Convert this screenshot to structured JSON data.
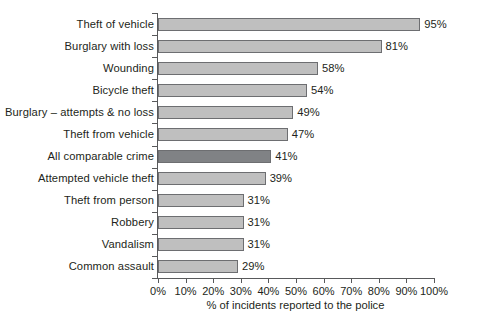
{
  "chart_data": {
    "type": "bar",
    "orientation": "horizontal",
    "title": "",
    "subtitle": "",
    "xlabel": "% of incidents reported to the police",
    "ylabel": "",
    "xlim": [
      0,
      100
    ],
    "xticks": [
      0,
      10,
      20,
      30,
      40,
      50,
      60,
      70,
      80,
      90,
      100
    ],
    "xtick_labels": [
      "0%",
      "10%",
      "20%",
      "30%",
      "40%",
      "50%",
      "60%",
      "70%",
      "80%",
      "90%",
      "100%"
    ],
    "grid": false,
    "legend": "none",
    "categories": [
      "Theft of vehicle",
      "Burglary with loss",
      "Wounding",
      "Bicycle theft",
      "Burglary – attempts & no loss",
      "Theft from vehicle",
      "All comparable crime",
      "Attempted vehicle theft",
      "Theft from person",
      "Robbery",
      "Vandalism",
      "Common assault"
    ],
    "values": [
      95,
      81,
      58,
      54,
      49,
      47,
      41,
      39,
      31,
      31,
      31,
      29
    ],
    "value_labels": [
      "95%",
      "81%",
      "58%",
      "54%",
      "49%",
      "47%",
      "41%",
      "39%",
      "31%",
      "31%",
      "31%",
      "29%"
    ],
    "highlighted_index": 6,
    "colors": {
      "bar_fill": "#bfbfbf",
      "bar_highlight_fill": "#808285",
      "bar_border": "#6d6e71",
      "axis": "#58595b",
      "text": "#231f20",
      "background": "#ffffff"
    }
  }
}
